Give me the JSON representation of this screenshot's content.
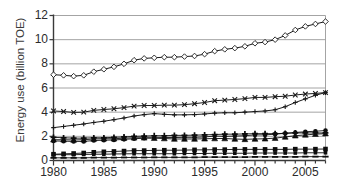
{
  "chart_data": {
    "type": "line",
    "title": "",
    "xlabel": "",
    "ylabel": "Energy use (billion TOE)",
    "xlim": [
      1980,
      2007
    ],
    "ylim": [
      0,
      12
    ],
    "yticks": [
      0,
      2,
      4,
      6,
      8,
      10,
      12
    ],
    "xticks": [
      1980,
      1985,
      1990,
      1995,
      2000,
      2005
    ],
    "grid": "horizontal",
    "legend": "none",
    "x": [
      1980,
      1981,
      1982,
      1983,
      1984,
      1985,
      1986,
      1987,
      1988,
      1989,
      1990,
      1991,
      1992,
      1993,
      1994,
      1995,
      1996,
      1997,
      1998,
      1999,
      2000,
      2001,
      2002,
      2003,
      2004,
      2005,
      2006,
      2007
    ],
    "series": [
      {
        "name": "World total",
        "marker": "diamond-open",
        "color": "#1a1a1a",
        "values": [
          7.1,
          7.05,
          6.98,
          7.05,
          7.35,
          7.55,
          7.75,
          8.0,
          8.3,
          8.45,
          8.5,
          8.55,
          8.55,
          8.6,
          8.65,
          8.8,
          9.05,
          9.2,
          9.3,
          9.45,
          9.7,
          9.8,
          10.0,
          10.35,
          10.8,
          11.1,
          11.3,
          11.5
        ]
      },
      {
        "name": "OECD",
        "marker": "cross-x",
        "color": "#1a1a1a",
        "values": [
          4.1,
          4.05,
          3.98,
          4.0,
          4.15,
          4.22,
          4.28,
          4.38,
          4.5,
          4.55,
          4.55,
          4.58,
          4.58,
          4.62,
          4.7,
          4.8,
          4.95,
          5.0,
          5.05,
          5.12,
          5.22,
          5.22,
          5.28,
          5.32,
          5.42,
          5.5,
          5.55,
          5.62
        ]
      },
      {
        "name": "Non-OECD",
        "marker": "plus",
        "color": "#1a1a1a",
        "values": [
          2.72,
          2.82,
          2.92,
          3.02,
          3.15,
          3.25,
          3.38,
          3.52,
          3.68,
          3.8,
          3.88,
          3.82,
          3.78,
          3.78,
          3.8,
          3.85,
          3.92,
          3.95,
          3.95,
          4.0,
          4.05,
          4.1,
          4.2,
          4.45,
          4.8,
          5.1,
          5.4,
          5.62
        ]
      },
      {
        "name": "Oil",
        "marker": "plus-filled",
        "color": "#0d0d0d",
        "values": [
          1.92,
          1.88,
          1.85,
          1.85,
          1.88,
          1.88,
          1.92,
          1.95,
          2.0,
          2.02,
          2.05,
          2.05,
          2.08,
          2.08,
          2.1,
          2.12,
          2.15,
          2.18,
          2.18,
          2.2,
          2.22,
          2.22,
          2.22,
          2.25,
          2.28,
          2.28,
          2.28,
          2.28
        ]
      },
      {
        "name": "Coal",
        "marker": "triangle-filled",
        "color": "#0d0d0d",
        "values": [
          1.72,
          1.72,
          1.7,
          1.72,
          1.78,
          1.8,
          1.8,
          1.85,
          1.88,
          1.88,
          1.85,
          1.82,
          1.78,
          1.78,
          1.78,
          1.8,
          1.82,
          1.82,
          1.78,
          1.75,
          1.78,
          1.8,
          1.85,
          1.95,
          2.05,
          2.12,
          2.18,
          2.22
        ]
      },
      {
        "name": "Natural gas",
        "marker": "circle-filled",
        "color": "#0d0d0d",
        "values": [
          1.62,
          1.6,
          1.58,
          1.58,
          1.65,
          1.68,
          1.7,
          1.75,
          1.8,
          1.85,
          1.88,
          1.9,
          1.9,
          1.92,
          1.92,
          1.95,
          2.02,
          2.0,
          2.02,
          2.05,
          2.12,
          2.12,
          2.18,
          2.25,
          2.32,
          2.38,
          2.42,
          2.48
        ]
      },
      {
        "name": "Hydro / nuclear",
        "marker": "square-filled",
        "color": "#0d0d0d",
        "values": [
          0.52,
          0.55,
          0.58,
          0.62,
          0.68,
          0.72,
          0.75,
          0.78,
          0.82,
          0.82,
          0.84,
          0.85,
          0.85,
          0.86,
          0.88,
          0.88,
          0.9,
          0.9,
          0.92,
          0.92,
          0.92,
          0.92,
          0.92,
          0.92,
          0.94,
          0.94,
          0.94,
          0.95
        ]
      },
      {
        "name": "Renewables",
        "marker": "square-small-filled",
        "color": "#0d0d0d",
        "values": [
          0.48,
          0.48,
          0.48,
          0.5,
          0.52,
          0.52,
          0.54,
          0.55,
          0.56,
          0.56,
          0.56,
          0.56,
          0.56,
          0.58,
          0.58,
          0.58,
          0.6,
          0.6,
          0.6,
          0.6,
          0.62,
          0.62,
          0.62,
          0.62,
          0.62,
          0.64,
          0.64,
          0.64
        ]
      },
      {
        "name": "Other",
        "marker": "dash",
        "color": "#0d0d0d",
        "values": [
          0.22,
          0.22,
          0.22,
          0.22,
          0.24,
          0.24,
          0.24,
          0.25,
          0.25,
          0.25,
          0.26,
          0.26,
          0.26,
          0.26,
          0.26,
          0.28,
          0.28,
          0.28,
          0.28,
          0.28,
          0.3,
          0.3,
          0.3,
          0.3,
          0.3,
          0.32,
          0.32,
          0.32
        ]
      }
    ]
  }
}
